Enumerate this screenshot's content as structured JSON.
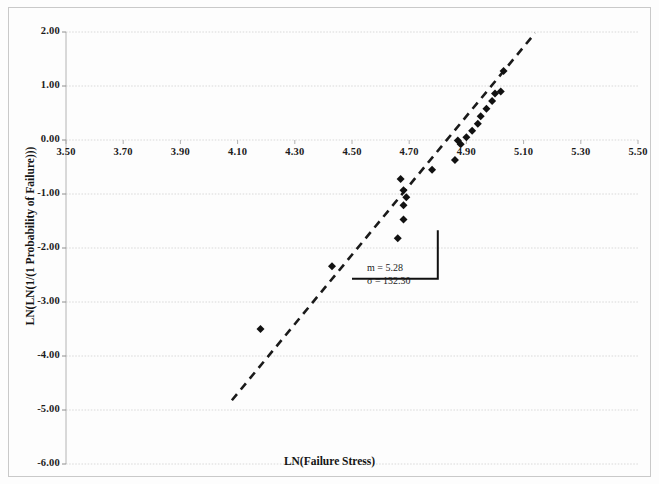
{
  "chart_data": {
    "type": "scatter",
    "title": "",
    "xlabel": "LN(Failure Stress)",
    "ylabel": "LN(LN(1/(1 Probability of Failure)))",
    "xlim": [
      3.5,
      5.5
    ],
    "ylim": [
      -6.0,
      2.0
    ],
    "xticks": [
      "3.50",
      "3.70",
      "3.90",
      "4.10",
      "4.30",
      "4.50",
      "4.70",
      "4.90",
      "5.10",
      "5.30",
      "5.50"
    ],
    "xtick_values": [
      3.5,
      3.7,
      3.9,
      4.1,
      4.3,
      4.5,
      4.7,
      4.9,
      5.1,
      5.3,
      5.5
    ],
    "yticks": [
      "2.00",
      "1.00",
      "0.00",
      "-1.00",
      "-2.00",
      "-3.00",
      "-4.00",
      "-5.00",
      "-6.00"
    ],
    "ytick_values": [
      2.0,
      1.0,
      0.0,
      -1.0,
      -2.0,
      -3.0,
      -4.0,
      -5.0,
      -6.0
    ],
    "grid": true,
    "grid_axis": "y",
    "legend": "none",
    "marker": "diamond",
    "marker_color": "#111111",
    "points": [
      {
        "x": 4.18,
        "y": -3.5
      },
      {
        "x": 4.43,
        "y": -2.34
      },
      {
        "x": 4.66,
        "y": -1.82
      },
      {
        "x": 4.68,
        "y": -1.47
      },
      {
        "x": 4.68,
        "y": -1.21
      },
      {
        "x": 4.69,
        "y": -1.06
      },
      {
        "x": 4.68,
        "y": -0.93
      },
      {
        "x": 4.67,
        "y": -0.72
      },
      {
        "x": 4.78,
        "y": -0.55
      },
      {
        "x": 4.86,
        "y": -0.37
      },
      {
        "x": 4.88,
        "y": -0.08
      },
      {
        "x": 4.87,
        "y": -0.01
      },
      {
        "x": 4.9,
        "y": 0.05
      },
      {
        "x": 4.92,
        "y": 0.17
      },
      {
        "x": 4.94,
        "y": 0.3
      },
      {
        "x": 4.95,
        "y": 0.44
      },
      {
        "x": 4.97,
        "y": 0.58
      },
      {
        "x": 4.99,
        "y": 0.72
      },
      {
        "x": 5.0,
        "y": 0.86
      },
      {
        "x": 5.02,
        "y": 0.9
      },
      {
        "x": 5.03,
        "y": 1.28
      }
    ],
    "trendline": {
      "style": "dashed",
      "color": "#1a1a1a",
      "x_start": 4.08,
      "y_start": -4.82,
      "x_end": 5.14,
      "y_end": 1.98
    },
    "slope_marker": {
      "description": "right-angle slope triangle",
      "x_left": 4.5,
      "x_right": 4.8,
      "y_bottom": -2.57,
      "y_top": -1.67
    },
    "annotations": [
      {
        "name": "slope-annotation",
        "text": "m = 5.28"
      },
      {
        "name": "sigma-annotation",
        "text": "σ = 132.30"
      }
    ]
  },
  "annot": {
    "m": "m = 5.28",
    "sigma": "σ = 132.30"
  }
}
